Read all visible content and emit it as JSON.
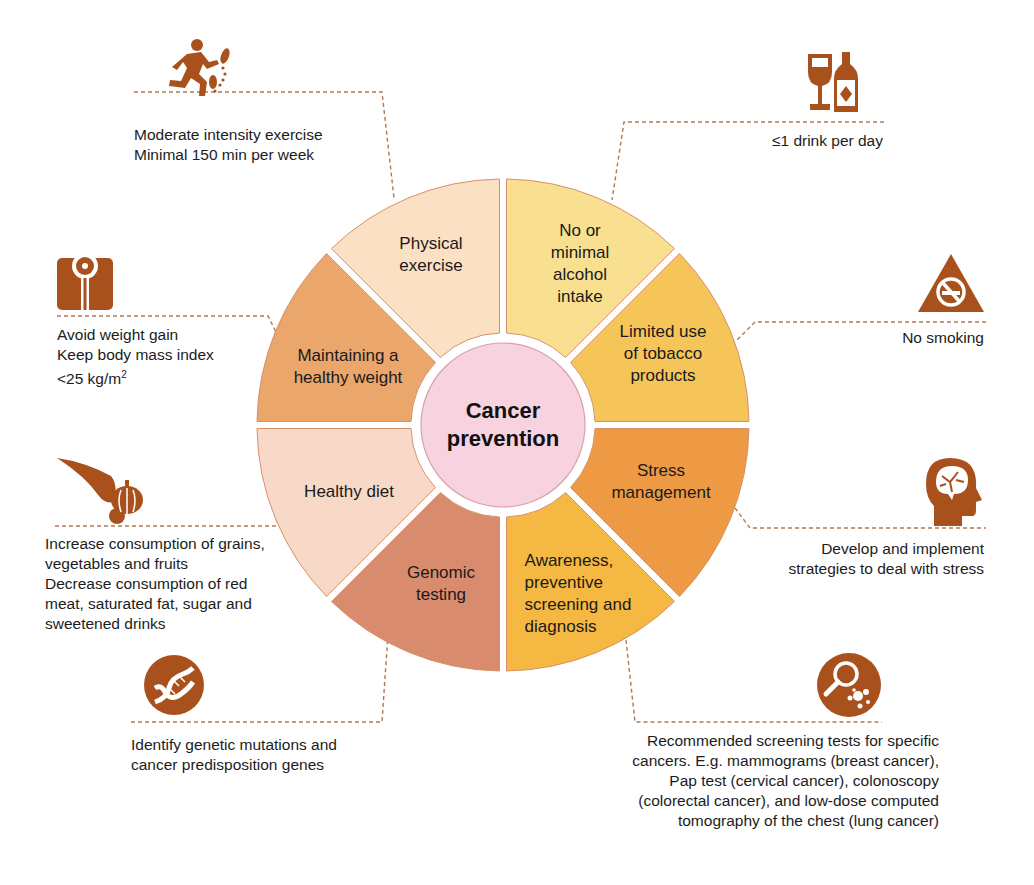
{
  "diagram": {
    "title": "Cancer prevention",
    "center": {
      "label": "Cancer\nprevention",
      "color": "#f6d3de",
      "stroke": "#d9a0a8"
    },
    "icon_color": "#a9511c",
    "connector_color": "#b07a55",
    "segments": [
      {
        "id": "alcohol",
        "label": "No or\nminimal\nalcohol\nintake",
        "color": "#f8e090"
      },
      {
        "id": "tobacco",
        "label": "Limited use\nof tobacco\nproducts",
        "color": "#f6c55a"
      },
      {
        "id": "stress",
        "label": "Stress\nmanagement",
        "color": "#ee9a45"
      },
      {
        "id": "screening",
        "label": "Awareness,\npreventive\nscreening and\ndiagnosis",
        "color": "#f5b842"
      },
      {
        "id": "genomic",
        "label": "Genomic\ntesting",
        "color": "#d98b6e"
      },
      {
        "id": "diet",
        "label": "Healthy diet",
        "color": "#f8d9c8"
      },
      {
        "id": "weight",
        "label": "Maintaining a\nhealthy weight",
        "color": "#eba66b"
      },
      {
        "id": "exercise",
        "label": "Physical\nexercise",
        "color": "#fbe0c4"
      }
    ],
    "notes": {
      "exercise": "Moderate intensity exercise\nMinimal 150 min per week",
      "alcohol": "≤1 drink per day",
      "weight_line1": "Avoid weight gain",
      "weight_line2": "Keep body mass index",
      "weight_line3": "<25 kg/m",
      "weight_sup": "2",
      "smoking": "No smoking",
      "diet": "Increase consumption of grains,\nvegetables and fruits\nDecrease consumption of red\nmeat, saturated fat, sugar and\nsweetened drinks",
      "stress": "Develop and implement\nstrategies to deal with stress",
      "genomic": "Identify genetic mutations and\ncancer predisposition genes",
      "screening": "Recommended screening tests for specific\ncancers.  E.g. mammograms (breast cancer),\nPap test (cervical cancer), colonoscopy\n(colorectal cancer), and low-dose computed\ntomography of the chest (lung cancer)"
    },
    "icons": {
      "exercise": "running-person-icon",
      "alcohol": "wine-glass-bottle-icon",
      "weight": "weighing-scale-icon",
      "smoking": "no-smoking-icon",
      "diet": "cornucopia-icon",
      "stress": "brain-head-icon",
      "genomic": "dna-icon",
      "screening": "magnifier-cells-icon"
    }
  }
}
